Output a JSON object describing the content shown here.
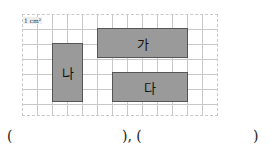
{
  "figure": {
    "unit_label": "1 cm²",
    "grid": {
      "columns": 13,
      "rows": 7,
      "cell_px": 15
    },
    "shapes": [
      {
        "label": "가",
        "col": 5,
        "row": 1,
        "width_cells": 6,
        "height_cells": 2
      },
      {
        "label": "나",
        "col": 2,
        "row": 2,
        "width_cells": 2,
        "height_cells": 4
      },
      {
        "label": "다",
        "col": 6,
        "row": 4,
        "width_cells": 5,
        "height_cells": 2
      }
    ]
  },
  "answers": {
    "open1": "(",
    "close1_sep": "), (",
    "close2": ")"
  }
}
